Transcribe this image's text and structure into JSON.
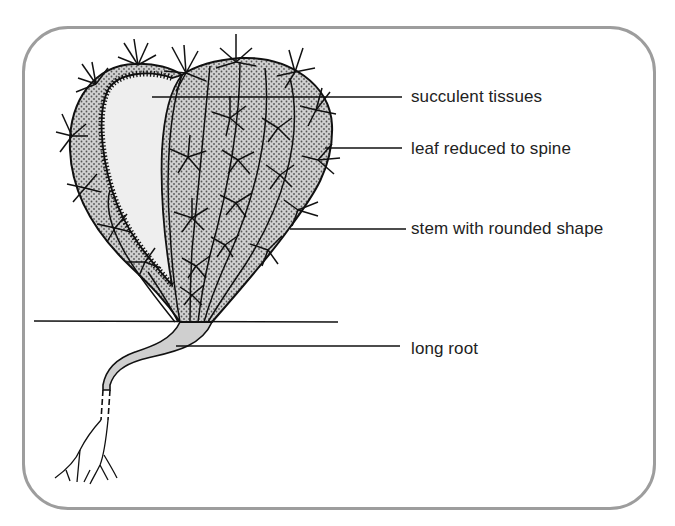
{
  "diagram": {
    "title": "",
    "labels": [
      {
        "id": "succulent-tissues",
        "text": "succulent tissues",
        "y": 87
      },
      {
        "id": "leaf-reduced-to-spine",
        "text": "leaf reduced to spine",
        "y": 139
      },
      {
        "id": "stem-with-rounded-shape",
        "text": "stem with rounded shape",
        "y": 219
      },
      {
        "id": "long-root",
        "text": "long root",
        "y": 339
      }
    ],
    "colors": {
      "frame": "#9d9d9d",
      "outline": "#111111",
      "stem_fill": "#c8c8c8",
      "tissue_fill": "#ededed",
      "text": "#222222"
    }
  }
}
